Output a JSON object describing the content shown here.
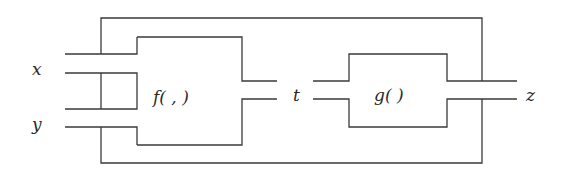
{
  "diagram": {
    "type": "function composition block diagram",
    "inputs": [
      {
        "id": "x",
        "label": "x"
      },
      {
        "id": "y",
        "label": "y"
      }
    ],
    "intermediate": {
      "id": "t",
      "label": "t"
    },
    "output": {
      "id": "z",
      "label": "z"
    },
    "blocks": [
      {
        "id": "f",
        "label": "f( , )",
        "inputs": [
          "x",
          "y"
        ],
        "output": "t"
      },
      {
        "id": "g",
        "label": "g( )",
        "inputs": [
          "t"
        ],
        "output": "z"
      }
    ],
    "outer_box": {
      "contains": [
        "f",
        "g"
      ]
    },
    "colors": {
      "line": "#3a3a3a",
      "text": "#2a2a2a",
      "background": "#ffffff"
    }
  }
}
